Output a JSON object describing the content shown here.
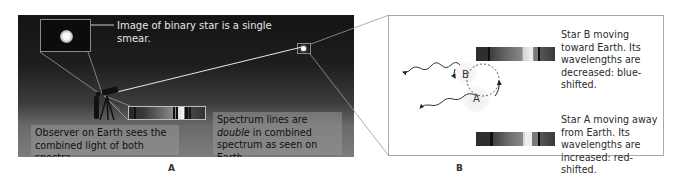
{
  "panel_a": {
    "label": "A",
    "inset_caption": "Image of binary star is a single smear.",
    "spectrum_caption_prefix": "Spectrum lines are ",
    "spectrum_caption_emphasis": "double",
    "spectrum_caption_suffix": " in combined spectrum as seen on Earth.",
    "observer_caption": "Observer on Earth sees the combined light of both spectra.",
    "icons": [
      "binary-star-smear-icon",
      "telescope-icon",
      "observer-icon",
      "distant-star-icon",
      "combined-spectrum-icon"
    ]
  },
  "panel_b": {
    "label": "B",
    "star_b": {
      "label": "B",
      "caption": "Star B moving toward Earth. Its wavelengths are decreased: blue-shifted."
    },
    "star_a": {
      "label": "A",
      "caption": "Star A moving away from Earth. Its wavelengths are increased: red-shifted."
    },
    "icons": [
      "blue-shifted-spectrum-icon",
      "red-shifted-spectrum-icon",
      "orbit-path-icon",
      "light-wave-arrow-icon"
    ]
  },
  "colors": {
    "sky_top": "#141414",
    "sky_bottom": "#7c7c7c",
    "panel_border": "#a8a8a8",
    "caption_box": "#969696"
  }
}
